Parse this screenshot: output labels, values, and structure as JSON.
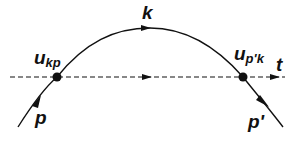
{
  "diagram": {
    "labels": {
      "k": "k",
      "t": "t",
      "p": "p",
      "p_prime": "p'",
      "u_main_1": "u",
      "u_sub_1": "kp",
      "u_main_2": "u",
      "u_sub_2": "p'k"
    },
    "colors": {
      "line": "#111111",
      "background": "#ffffff"
    }
  }
}
